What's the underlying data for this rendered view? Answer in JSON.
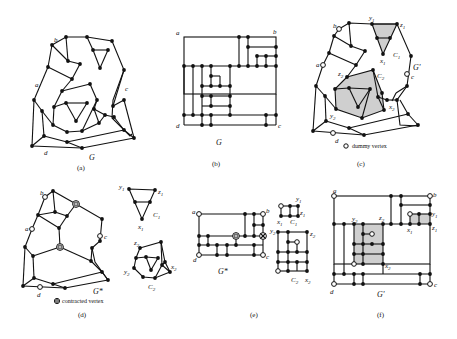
{
  "figure": {
    "panels": [
      {
        "id": "a",
        "caption": "(a)",
        "graph_label": "G",
        "vertex_labels": [
          "a",
          "b",
          "c",
          "d"
        ]
      },
      {
        "id": "b",
        "caption": "(b)",
        "graph_label": "G",
        "vertex_labels": [
          "a",
          "b",
          "c",
          "d"
        ]
      },
      {
        "id": "c",
        "caption": "(c)",
        "graph_label": "G'",
        "vertex_labels": [
          "a",
          "b",
          "c",
          "d",
          "y1",
          "z1",
          "x1",
          "y2",
          "z2",
          "x2"
        ],
        "cycle_labels": [
          "C1",
          "C2"
        ],
        "legend": "dummy vertex"
      },
      {
        "id": "d",
        "caption": "(d)",
        "graph_label": "G*",
        "vertex_labels": [
          "a",
          "b",
          "c",
          "d",
          "y1",
          "z1",
          "x1",
          "y2",
          "z2",
          "x2"
        ],
        "cycle_labels": [
          "C1",
          "C2"
        ],
        "legend": "contracted vertex"
      },
      {
        "id": "e",
        "caption": "(e)",
        "graph_label": "G*",
        "vertex_labels": [
          "a",
          "b",
          "c",
          "d",
          "y1",
          "z1",
          "x1",
          "y2",
          "z2",
          "x2"
        ],
        "cycle_labels": [
          "C1",
          "C2"
        ]
      },
      {
        "id": "f",
        "caption": "(f)",
        "graph_label": "G'",
        "vertex_labels": [
          "a",
          "b",
          "c",
          "d",
          "y1",
          "z1",
          "x1",
          "y2",
          "z2",
          "x2"
        ]
      }
    ],
    "labels": {
      "a": "a",
      "b": "b",
      "c": "c",
      "d": "d",
      "y1": "y",
      "z1": "z",
      "x1": "x",
      "y2": "y",
      "z2": "z",
      "x2": "x",
      "sub1": "1",
      "sub2": "2",
      "C": "C",
      "G": "G",
      "Gp": "G'",
      "Gs": "G*"
    },
    "legend": {
      "dummy": "dummy vertex",
      "contracted": "contracted vertex"
    },
    "captions": {
      "a": "(a)",
      "b": "(b)",
      "c": "(c)",
      "d": "(d)",
      "e": "(e)",
      "f": "(f)"
    }
  }
}
